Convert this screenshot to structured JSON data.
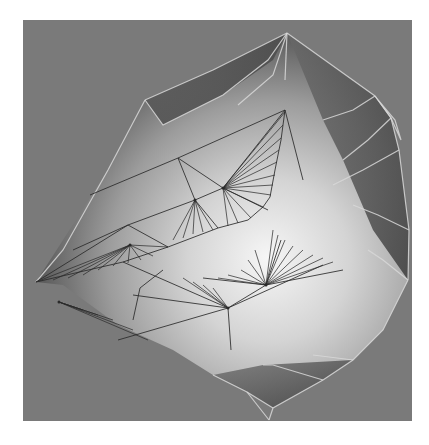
{
  "render": {
    "background_color": "#7a7a7a",
    "page_color": "#ffffff",
    "highlight_color": "#f4f4f4",
    "shade_color": "#3a3a3a",
    "wire_dark": "#2a2a2a",
    "wire_light": "#d8d8d8"
  },
  "mesh": {
    "silhouette": [
      [
        264,
        13
      ],
      [
        352,
        76
      ],
      [
        368,
        98
      ],
      [
        376,
        130
      ],
      [
        386,
        210
      ],
      [
        385,
        260
      ],
      [
        360,
        310
      ],
      [
        330,
        340
      ],
      [
        300,
        360
      ],
      [
        250,
        388
      ],
      [
        224,
        372
      ],
      [
        190,
        355
      ],
      [
        150,
        330
      ],
      [
        95,
        305
      ],
      [
        40,
        265
      ],
      [
        13,
        262
      ],
      [
        85,
        150
      ],
      [
        122,
        80
      ],
      [
        190,
        50
      ],
      [
        264,
        13
      ]
    ],
    "dark_facets": [
      [
        [
          264,
          13
        ],
        [
          352,
          76
        ],
        [
          368,
          98
        ],
        [
          376,
          130
        ],
        [
          386,
          210
        ],
        [
          385,
          260
        ],
        [
          350,
          210
        ],
        [
          320,
          140
        ],
        [
          300,
          100
        ]
      ],
      [
        [
          122,
          80
        ],
        [
          190,
          50
        ],
        [
          264,
          13
        ],
        [
          250,
          40
        ],
        [
          200,
          75
        ],
        [
          140,
          105
        ]
      ],
      [
        [
          190,
          355
        ],
        [
          224,
          372
        ],
        [
          250,
          388
        ],
        [
          300,
          360
        ],
        [
          330,
          340
        ],
        [
          240,
          345
        ]
      ]
    ],
    "dark_edges": [
      [
        [
          13,
          262
        ],
        [
          100,
          242
        ],
        [
          145,
          227
        ],
        [
          195,
          208
        ],
        [
          225,
          200
        ],
        [
          240,
          187
        ],
        [
          247,
          177
        ]
      ],
      [
        [
          247,
          177
        ],
        [
          252,
          150
        ],
        [
          258,
          120
        ],
        [
          262,
          90
        ]
      ],
      [
        [
          262,
          90
        ],
        [
          155,
          138
        ],
        [
          67,
          175
        ]
      ],
      [
        [
          155,
          138
        ],
        [
          200,
          168
        ]
      ],
      [
        [
          200,
          168
        ],
        [
          262,
          90
        ]
      ],
      [
        [
          155,
          138
        ],
        [
          172,
          180
        ]
      ],
      [
        [
          172,
          180
        ],
        [
          105,
          205
        ],
        [
          50,
          230
        ]
      ],
      [
        [
          172,
          180
        ],
        [
          200,
          168
        ]
      ],
      [
        [
          105,
          205
        ],
        [
          13,
          262
        ]
      ],
      [
        [
          105,
          205
        ],
        [
          145,
          227
        ]
      ],
      [
        [
          172,
          180
        ],
        [
          195,
          208
        ]
      ],
      [
        [
          100,
          242
        ],
        [
          205,
          288
        ],
        [
          300,
          245
        ]
      ],
      [
        [
          205,
          288
        ],
        [
          110,
          275
        ]
      ],
      [
        [
          205,
          288
        ],
        [
          95,
          320
        ]
      ],
      [
        [
          205,
          288
        ],
        [
          208,
          330
        ]
      ],
      [
        [
          117,
          268
        ],
        [
          140,
          250
        ]
      ],
      [
        [
          117,
          268
        ],
        [
          110,
          300
        ]
      ],
      [
        [
          243,
          265
        ],
        [
          320,
          250
        ]
      ],
      [
        [
          243,
          265
        ],
        [
          258,
          220
        ]
      ],
      [
        [
          243,
          265
        ],
        [
          205,
          288
        ]
      ],
      [
        [
          243,
          265
        ],
        [
          180,
          258
        ]
      ],
      [
        [
          200,
          168
        ],
        [
          245,
          190
        ]
      ],
      [
        [
          262,
          90
        ],
        [
          280,
          160
        ]
      ]
    ],
    "fans": [
      {
        "center": [
          107,
          225
        ],
        "targets": [
          [
            13,
            262
          ],
          [
            30,
            260
          ],
          [
            45,
            258
          ],
          [
            60,
            255
          ],
          [
            75,
            250
          ],
          [
            90,
            246
          ],
          [
            105,
            243
          ],
          [
            118,
            240
          ],
          [
            130,
            236
          ],
          [
            145,
            227
          ]
        ]
      },
      {
        "center": [
          200,
          168
        ],
        "targets": [
          [
            262,
            92
          ],
          [
            260,
            105
          ],
          [
            258,
            118
          ],
          [
            256,
            130
          ],
          [
            254,
            142
          ],
          [
            252,
            155
          ],
          [
            250,
            165
          ],
          [
            248,
            175
          ],
          [
            240,
            187
          ],
          [
            228,
            198
          ],
          [
            215,
            203
          ],
          [
            205,
            206
          ]
        ]
      },
      {
        "center": [
          172,
          180
        ],
        "targets": [
          [
            150,
            220
          ],
          [
            160,
            218
          ],
          [
            170,
            214
          ],
          [
            180,
            212
          ],
          [
            190,
            210
          ]
        ]
      },
      {
        "center": [
          243,
          265
        ],
        "targets": [
          [
            250,
            210
          ],
          [
            255,
            215
          ],
          [
            262,
            220
          ],
          [
            270,
            226
          ],
          [
            280,
            230
          ],
          [
            290,
            235
          ],
          [
            300,
            238
          ],
          [
            310,
            242
          ],
          [
            232,
            230
          ],
          [
            225,
            240
          ],
          [
            218,
            250
          ],
          [
            205,
            255
          ],
          [
            195,
            258
          ]
        ]
      },
      {
        "center": [
          205,
          288
        ],
        "targets": [
          [
            160,
            258
          ],
          [
            170,
            262
          ],
          [
            180,
            265
          ],
          [
            190,
            268
          ]
        ]
      },
      {
        "center": [
          36,
          282
        ],
        "targets": [
          [
            60,
            290
          ],
          [
            75,
            295
          ],
          [
            90,
            300
          ],
          [
            110,
            310
          ],
          [
            125,
            320
          ]
        ]
      }
    ],
    "light_edges": [
      [
        [
          122,
          80
        ],
        [
          190,
          50
        ],
        [
          264,
          13
        ]
      ],
      [
        [
          264,
          13
        ],
        [
          352,
          76
        ],
        [
          368,
          98
        ],
        [
          376,
          130
        ],
        [
          386,
          210
        ],
        [
          385,
          260
        ]
      ],
      [
        [
          385,
          260
        ],
        [
          360,
          310
        ],
        [
          330,
          340
        ],
        [
          300,
          360
        ],
        [
          250,
          388
        ],
        [
          246,
          400
        ]
      ],
      [
        [
          250,
          388
        ],
        [
          224,
          372
        ],
        [
          190,
          355
        ]
      ],
      [
        [
          122,
          80
        ],
        [
          85,
          150
        ],
        [
          40,
          230
        ],
        [
          13,
          262
        ]
      ],
      [
        [
          264,
          13
        ],
        [
          245,
          40
        ],
        [
          200,
          75
        ],
        [
          140,
          105
        ],
        [
          122,
          80
        ]
      ],
      [
        [
          264,
          13
        ],
        [
          250,
          55
        ],
        [
          215,
          85
        ]
      ],
      [
        [
          264,
          13
        ],
        [
          262,
          60
        ]
      ],
      [
        [
          352,
          76
        ],
        [
          330,
          90
        ],
        [
          300,
          100
        ]
      ],
      [
        [
          368,
          98
        ],
        [
          345,
          120
        ],
        [
          320,
          140
        ]
      ],
      [
        [
          376,
          130
        ],
        [
          340,
          150
        ],
        [
          310,
          165
        ]
      ],
      [
        [
          386,
          210
        ],
        [
          355,
          195
        ],
        [
          330,
          185
        ]
      ],
      [
        [
          385,
          260
        ],
        [
          360,
          240
        ],
        [
          345,
          230
        ]
      ],
      [
        [
          300,
          360
        ],
        [
          250,
          345
        ],
        [
          240,
          345
        ]
      ],
      [
        [
          330,
          340
        ],
        [
          290,
          335
        ]
      ],
      [
        [
          224,
          372
        ],
        [
          246,
          400
        ]
      ],
      [
        [
          352,
          76
        ],
        [
          368,
          98
        ],
        [
          378,
          120
        ],
        [
          372,
          100
        ],
        [
          355,
          80
        ]
      ]
    ]
  }
}
